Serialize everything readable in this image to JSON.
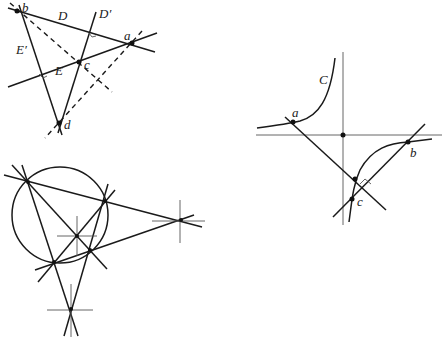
{
  "figure_top_left": {
    "points": {
      "a": "a",
      "b": "b",
      "c": "c",
      "d": "d"
    },
    "lines": {
      "D": "D",
      "D_prime": "D′",
      "E": "E",
      "E_prime": "E′"
    }
  },
  "figure_right": {
    "curve": "C",
    "points": {
      "a": "a",
      "b": "b",
      "c": "c"
    }
  }
}
